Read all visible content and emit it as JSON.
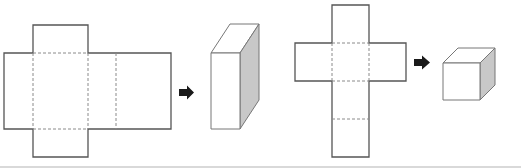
{
  "diagram": {
    "description": "Two nets folding into 3D solids",
    "colors": {
      "outline": "#555555",
      "fold_line": "#8a8a8a",
      "arrow": "#1a1a1a",
      "shaded_face": "#c8c8c8",
      "solid_edge": "#777777",
      "bottom_rule": "#d9d9d9"
    },
    "panels": [
      {
        "net": "rectangular-prism-net",
        "arrow": "right-arrow",
        "result": "rectangular-prism"
      },
      {
        "net": "cube-net-cross",
        "arrow": "right-arrow",
        "result": "cube"
      }
    ]
  }
}
